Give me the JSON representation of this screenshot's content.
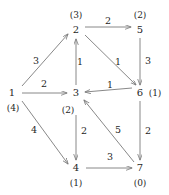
{
  "figure": {
    "kind": "weighted-directed-graph",
    "stroke_color": "#7a7a7a",
    "text_color": "#1f1f1f",
    "background": "#ffffff"
  },
  "nodes": [
    {
      "id": "n1",
      "label": "1",
      "dist": "(4)",
      "x": 12,
      "y": 93,
      "dist_x": 13,
      "dist_y": 108,
      "dist_inline": false
    },
    {
      "id": "n2",
      "label": "2",
      "dist": "(3)",
      "x": 76,
      "y": 30,
      "dist_x": 76,
      "dist_y": 15,
      "dist_inline": false
    },
    {
      "id": "n3",
      "label": "3",
      "dist": "(2)",
      "x": 76,
      "y": 93,
      "dist_x": 68,
      "dist_y": 110,
      "dist_inline": false
    },
    {
      "id": "n4",
      "label": "4",
      "dist": "(1)",
      "x": 76,
      "y": 168,
      "dist_x": 76,
      "dist_y": 183,
      "dist_inline": false
    },
    {
      "id": "n5",
      "label": "5",
      "dist": "(2)",
      "x": 140,
      "y": 30,
      "dist_x": 140,
      "dist_y": 15,
      "dist_inline": false
    },
    {
      "id": "n6",
      "label": "6",
      "dist": "(1)",
      "x": 140,
      "y": 93,
      "dist_x": 155,
      "dist_y": 93,
      "dist_inline": true
    },
    {
      "id": "n7",
      "label": "7",
      "dist": "(0)",
      "x": 140,
      "y": 168,
      "dist_x": 140,
      "dist_y": 183,
      "dist_inline": false
    }
  ],
  "edges": [
    {
      "id": "e1",
      "from": "n1",
      "to": "n2",
      "weight": "3",
      "wx": 36,
      "wy": 61
    },
    {
      "id": "e2",
      "from": "n1",
      "to": "n3",
      "weight": "2",
      "wx": 44,
      "wy": 84
    },
    {
      "id": "e3",
      "from": "n1",
      "to": "n4",
      "weight": "4",
      "wx": 34,
      "wy": 130
    },
    {
      "id": "e4",
      "from": "n3",
      "to": "n2",
      "weight": "1",
      "wx": 80,
      "wy": 62
    },
    {
      "id": "e5",
      "from": "n2",
      "to": "n5",
      "weight": "2",
      "wx": 108,
      "wy": 21
    },
    {
      "id": "e6",
      "from": "n2",
      "to": "n6",
      "weight": "1",
      "wx": 118,
      "wy": 62
    },
    {
      "id": "e7",
      "from": "n5",
      "to": "n6",
      "weight": "3",
      "wx": 148,
      "wy": 61
    },
    {
      "id": "e8",
      "from": "n6",
      "to": "n3",
      "weight": "1",
      "wx": 110,
      "wy": 85
    },
    {
      "id": "e9",
      "from": "n3",
      "to": "n4",
      "weight": "2",
      "wx": 84,
      "wy": 131
    },
    {
      "id": "e10",
      "from": "n6",
      "to": "n7",
      "weight": "2",
      "wx": 148,
      "wy": 131
    },
    {
      "id": "e11",
      "from": "n7",
      "to": "n3",
      "weight": "5",
      "wx": 118,
      "wy": 130
    },
    {
      "id": "e12",
      "from": "n4",
      "to": "n7",
      "weight": "3",
      "wx": 110,
      "wy": 157
    }
  ]
}
